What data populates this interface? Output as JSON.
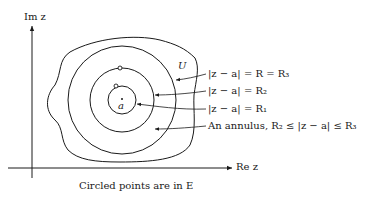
{
  "figure": {
    "axes": {
      "y_label": "Im z",
      "x_label": "Re z"
    },
    "center_label": "a",
    "region_label": "U",
    "annotations": [
      {
        "id": "outer_circle",
        "text": "|z − a| = R = R₃"
      },
      {
        "id": "middle_circle",
        "text": "|z − a| = R₂"
      },
      {
        "id": "inner_circle",
        "text": "|z − a| = R₁"
      },
      {
        "id": "annulus",
        "text": "An annulus, R₂ ≤ |z − a| ≤ R₃"
      }
    ],
    "caption": "Circled points are in E",
    "colors": {
      "ink": "#1a1a1a",
      "background": "#ffffff"
    }
  }
}
